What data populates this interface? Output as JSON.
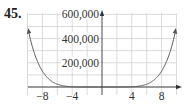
{
  "problem_number": "45.",
  "chart_data": {
    "type": "line",
    "title": "",
    "xlabel": "",
    "ylabel": "",
    "function_approx": "y = 0.5 x^6",
    "xlim": [
      -10,
      10
    ],
    "ylim": [
      0,
      600000
    ],
    "x_ticks": [
      -8,
      -4,
      4,
      8
    ],
    "x_tick_labels": [
      "−8",
      "−4",
      "4",
      "8"
    ],
    "y_ticks": [
      200000,
      400000,
      600000
    ],
    "y_tick_labels": [
      "200,000",
      "400,000",
      "600,000"
    ],
    "grid": {
      "x_step": 2,
      "y_step": 100000
    },
    "series": [
      {
        "name": "f(x)",
        "x": [
          -9.9,
          -9,
          -8,
          -7,
          -6,
          -5,
          -4,
          -3,
          -2,
          0,
          2,
          3,
          4,
          5,
          6,
          7,
          8,
          9,
          9.9
        ],
        "values": [
          470000,
          265720,
          131072,
          58825,
          23328,
          7813,
          2048,
          365,
          32,
          0,
          32,
          365,
          2048,
          7813,
          23328,
          58825,
          131072,
          265720,
          470000
        ]
      }
    ],
    "legend": null,
    "colors": {
      "curve": "#555555",
      "grid": "#cccccc",
      "axis": "#333333"
    }
  }
}
